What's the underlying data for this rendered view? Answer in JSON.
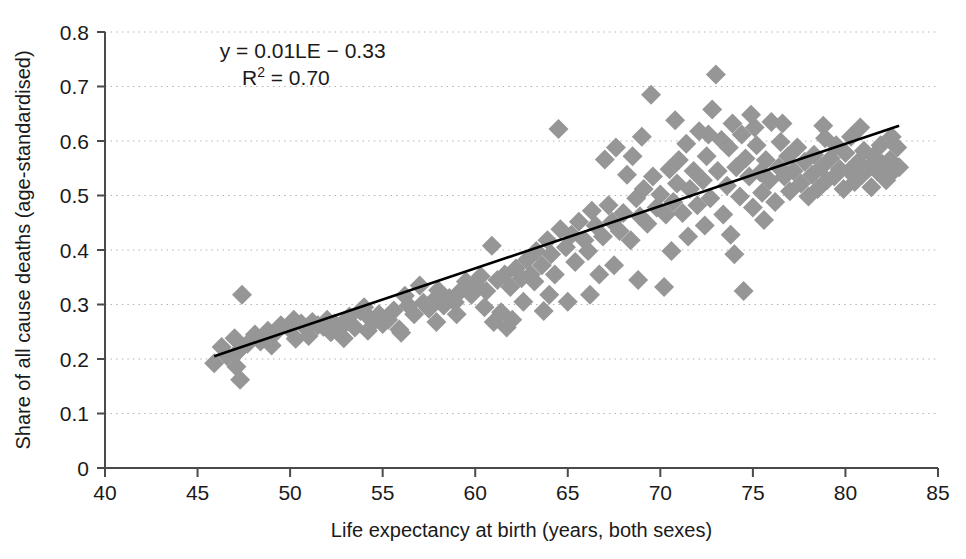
{
  "chart_data": {
    "type": "scatter",
    "title": "",
    "xlabel": "Life expectancy at birth (years, both sexes)",
    "ylabel": "Share of all cause deaths (age-standardised)",
    "xlim": [
      40,
      85
    ],
    "ylim": [
      0,
      0.8
    ],
    "xticks": [
      40,
      45,
      50,
      55,
      60,
      65,
      70,
      75,
      80,
      85
    ],
    "xtick_labels": [
      "40",
      "45",
      "50",
      "55",
      "60",
      "65",
      "70",
      "75",
      "80",
      "85"
    ],
    "yticks": [
      0,
      0.1,
      0.2,
      0.3,
      0.4,
      0.5,
      0.6,
      0.7,
      0.8
    ],
    "ytick_labels": [
      "0",
      "0.1",
      "0.2",
      "0.3",
      "0.4",
      "0.5",
      "0.6",
      "0.7",
      "0.8"
    ],
    "grid": "horizontal-dotted",
    "legend": "none",
    "marker": {
      "shape": "diamond",
      "color": "#969696",
      "size": 13
    },
    "annotations": [
      {
        "name": "regression-equation",
        "text": "y = 0.01LE − 0.33",
        "x": 46.2,
        "y": 0.765
      },
      {
        "name": "r-squared",
        "text": "R",
        "sup": "2",
        "text_tail": " = 0.70",
        "x": 47.4,
        "y": 0.715
      }
    ],
    "trendline": {
      "name": "linear-fit",
      "equation": "y = 0.01LE - 0.33",
      "r_squared": 0.7,
      "slope": 0.01,
      "intercept": -0.33,
      "color": "#000000",
      "width": 2.6,
      "x_start": 45.9,
      "x_end": 82.9,
      "y_start": 0.205,
      "y_end": 0.628
    },
    "points": [
      [
        45.9,
        0.192
      ],
      [
        46.3,
        0.222
      ],
      [
        46.6,
        0.205
      ],
      [
        47.0,
        0.238
      ],
      [
        47.1,
        0.186
      ],
      [
        47.2,
        0.214
      ],
      [
        47.3,
        0.162
      ],
      [
        47.4,
        0.318
      ],
      [
        47.7,
        0.228
      ],
      [
        48.1,
        0.245
      ],
      [
        48.4,
        0.232
      ],
      [
        48.8,
        0.252
      ],
      [
        49.2,
        0.248
      ],
      [
        49.5,
        0.262
      ],
      [
        49.9,
        0.258
      ],
      [
        50.2,
        0.272
      ],
      [
        50.3,
        0.237
      ],
      [
        50.6,
        0.265
      ],
      [
        50.9,
        0.258
      ],
      [
        51.2,
        0.268
      ],
      [
        51.5,
        0.262
      ],
      [
        51.8,
        0.259
      ],
      [
        52.0,
        0.272
      ],
      [
        52.2,
        0.249
      ],
      [
        52.4,
        0.265
      ],
      [
        52.7,
        0.261
      ],
      [
        53.0,
        0.266
      ],
      [
        53.2,
        0.278
      ],
      [
        53.5,
        0.258
      ],
      [
        53.8,
        0.288
      ],
      [
        54.0,
        0.295
      ],
      [
        54.3,
        0.275
      ],
      [
        54.5,
        0.268
      ],
      [
        54.8,
        0.282
      ],
      [
        55.0,
        0.264
      ],
      [
        55.3,
        0.272
      ],
      [
        55.6,
        0.289
      ],
      [
        55.9,
        0.254
      ],
      [
        56.2,
        0.316
      ],
      [
        56.4,
        0.298
      ],
      [
        56.7,
        0.282
      ],
      [
        57.0,
        0.335
      ],
      [
        57.2,
        0.303
      ],
      [
        57.5,
        0.292
      ],
      [
        57.8,
        0.309
      ],
      [
        58.0,
        0.326
      ],
      [
        58.3,
        0.298
      ],
      [
        58.6,
        0.312
      ],
      [
        58.9,
        0.304
      ],
      [
        59.2,
        0.325
      ],
      [
        59.5,
        0.342
      ],
      [
        59.8,
        0.318
      ],
      [
        60.0,
        0.338
      ],
      [
        60.3,
        0.352
      ],
      [
        60.6,
        0.325
      ],
      [
        60.9,
        0.408
      ],
      [
        61.0,
        0.268
      ],
      [
        61.2,
        0.345
      ],
      [
        61.4,
        0.286
      ],
      [
        61.6,
        0.355
      ],
      [
        61.9,
        0.332
      ],
      [
        62.0,
        0.272
      ],
      [
        62.2,
        0.366
      ],
      [
        62.5,
        0.348
      ],
      [
        62.8,
        0.382
      ],
      [
        63.0,
        0.355
      ],
      [
        63.3,
        0.398
      ],
      [
        63.6,
        0.372
      ],
      [
        63.9,
        0.418
      ],
      [
        64.1,
        0.392
      ],
      [
        64.3,
        0.355
      ],
      [
        64.5,
        0.622
      ],
      [
        64.6,
        0.438
      ],
      [
        64.9,
        0.405
      ],
      [
        65.2,
        0.428
      ],
      [
        65.4,
        0.378
      ],
      [
        65.6,
        0.452
      ],
      [
        65.9,
        0.418
      ],
      [
        66.1,
        0.398
      ],
      [
        66.3,
        0.472
      ],
      [
        66.5,
        0.445
      ],
      [
        66.7,
        0.355
      ],
      [
        66.9,
        0.425
      ],
      [
        67.0,
        0.566
      ],
      [
        67.2,
        0.482
      ],
      [
        67.4,
        0.452
      ],
      [
        67.6,
        0.588
      ],
      [
        67.8,
        0.435
      ],
      [
        68.0,
        0.468
      ],
      [
        68.2,
        0.538
      ],
      [
        68.4,
        0.418
      ],
      [
        68.5,
        0.572
      ],
      [
        68.7,
        0.495
      ],
      [
        68.9,
        0.462
      ],
      [
        69.1,
        0.512
      ],
      [
        69.3,
        0.448
      ],
      [
        69.5,
        0.685
      ],
      [
        69.6,
        0.535
      ],
      [
        69.8,
        0.478
      ],
      [
        70.0,
        0.502
      ],
      [
        70.2,
        0.332
      ],
      [
        70.3,
        0.465
      ],
      [
        70.5,
        0.548
      ],
      [
        70.7,
        0.488
      ],
      [
        70.9,
        0.522
      ],
      [
        71.0,
        0.565
      ],
      [
        71.2,
        0.468
      ],
      [
        71.4,
        0.595
      ],
      [
        71.6,
        0.512
      ],
      [
        71.8,
        0.545
      ],
      [
        72.0,
        0.482
      ],
      [
        72.1,
        0.618
      ],
      [
        72.3,
        0.528
      ],
      [
        72.5,
        0.572
      ],
      [
        72.7,
        0.495
      ],
      [
        72.8,
        0.658
      ],
      [
        73.0,
        0.722
      ],
      [
        73.1,
        0.545
      ],
      [
        73.3,
        0.602
      ],
      [
        73.4,
        0.465
      ],
      [
        73.6,
        0.518
      ],
      [
        73.7,
        0.588
      ],
      [
        73.9,
        0.632
      ],
      [
        74.0,
        0.392
      ],
      [
        74.1,
        0.552
      ],
      [
        74.3,
        0.498
      ],
      [
        74.4,
        0.612
      ],
      [
        74.5,
        0.325
      ],
      [
        74.6,
        0.568
      ],
      [
        74.8,
        0.535
      ],
      [
        75.0,
        0.478
      ],
      [
        75.1,
        0.625
      ],
      [
        75.2,
        0.592
      ],
      [
        75.4,
        0.542
      ],
      [
        75.5,
        0.505
      ],
      [
        75.7,
        0.565
      ],
      [
        75.9,
        0.528
      ],
      [
        76.0,
        0.635
      ],
      [
        76.2,
        0.488
      ],
      [
        76.4,
        0.552
      ],
      [
        76.5,
        0.598
      ],
      [
        76.7,
        0.535
      ],
      [
        76.9,
        0.572
      ],
      [
        77.0,
        0.508
      ],
      [
        77.2,
        0.545
      ],
      [
        77.4,
        0.588
      ],
      [
        77.6,
        0.522
      ],
      [
        77.8,
        0.562
      ],
      [
        78.0,
        0.498
      ],
      [
        78.2,
        0.538
      ],
      [
        78.3,
        0.575
      ],
      [
        78.5,
        0.512
      ],
      [
        78.7,
        0.552
      ],
      [
        78.9,
        0.605
      ],
      [
        79.0,
        0.528
      ],
      [
        79.2,
        0.568
      ],
      [
        79.4,
        0.535
      ],
      [
        79.5,
        0.592
      ],
      [
        79.7,
        0.548
      ],
      [
        79.9,
        0.512
      ],
      [
        80.0,
        0.578
      ],
      [
        80.2,
        0.545
      ],
      [
        80.3,
        0.608
      ],
      [
        80.5,
        0.525
      ],
      [
        80.7,
        0.562
      ],
      [
        80.9,
        0.538
      ],
      [
        81.0,
        0.582
      ],
      [
        81.2,
        0.548
      ],
      [
        81.4,
        0.515
      ],
      [
        81.5,
        0.572
      ],
      [
        81.7,
        0.545
      ],
      [
        81.9,
        0.592
      ],
      [
        82.0,
        0.558
      ],
      [
        82.2,
        0.528
      ],
      [
        82.4,
        0.565
      ],
      [
        82.6,
        0.545
      ],
      [
        82.8,
        0.588
      ],
      [
        82.9,
        0.552
      ],
      [
        63.2,
        0.342
      ],
      [
        65.0,
        0.305
      ],
      [
        66.2,
        0.318
      ],
      [
        67.5,
        0.372
      ],
      [
        68.8,
        0.345
      ],
      [
        70.6,
        0.398
      ],
      [
        71.5,
        0.425
      ],
      [
        72.4,
        0.445
      ],
      [
        73.8,
        0.428
      ],
      [
        75.6,
        0.455
      ],
      [
        62.6,
        0.305
      ],
      [
        64.0,
        0.318
      ],
      [
        69.0,
        0.608
      ],
      [
        70.8,
        0.638
      ],
      [
        72.6,
        0.612
      ],
      [
        74.9,
        0.648
      ],
      [
        76.6,
        0.632
      ],
      [
        78.8,
        0.628
      ],
      [
        80.8,
        0.625
      ],
      [
        82.5,
        0.608
      ],
      [
        61.7,
        0.258
      ],
      [
        63.7,
        0.288
      ],
      [
        59.0,
        0.282
      ],
      [
        60.5,
        0.295
      ],
      [
        57.9,
        0.268
      ],
      [
        56.0,
        0.248
      ],
      [
        54.2,
        0.252
      ],
      [
        52.9,
        0.238
      ],
      [
        51.0,
        0.242
      ],
      [
        49.0,
        0.225
      ]
    ]
  }
}
